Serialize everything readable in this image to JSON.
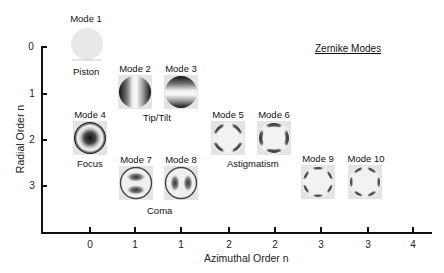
{
  "title": "Zernike Modes",
  "axes": {
    "y": {
      "label": "Radial Order n",
      "ticks": [
        "0",
        "1",
        "2",
        "3"
      ]
    },
    "x": {
      "label": "Azimuthal Order n",
      "ticks": [
        "0",
        "1",
        "1",
        "2",
        "2",
        "3",
        "3",
        "4"
      ]
    }
  },
  "modes": [
    {
      "label": "Mode 1",
      "pattern": "piston"
    },
    {
      "label": "Mode 2",
      "pattern": "tilt-x"
    },
    {
      "label": "Mode 3",
      "pattern": "tilt-y"
    },
    {
      "label": "Mode 4",
      "pattern": "focus"
    },
    {
      "label": "Mode 5",
      "pattern": "astigmatism-45"
    },
    {
      "label": "Mode 6",
      "pattern": "astigmatism-0"
    },
    {
      "label": "Mode 7",
      "pattern": "coma-y"
    },
    {
      "label": "Mode 8",
      "pattern": "coma-x"
    },
    {
      "label": "Mode 9",
      "pattern": "trefoil-a"
    },
    {
      "label": "Mode 10",
      "pattern": "trefoil-b"
    }
  ],
  "groups": {
    "piston": "Piston",
    "tiptilt": "Tip/Tilt",
    "focus": "Focus",
    "astigmatism": "Astigmatism",
    "coma": "Coma"
  },
  "colors": {
    "axis": "#111111",
    "tile_background": "#e4e4e4",
    "pattern_dark": "#1a1a1a",
    "pattern_light": "#f2f2f2"
  }
}
